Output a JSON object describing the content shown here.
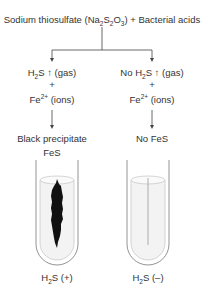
{
  "title": {
    "prefix": "Sodium thiosulfate (Na",
    "sub1": "2",
    "mid1": "S",
    "sub2": "2",
    "mid2": "O",
    "sub3": "3",
    "suffix": ") + Bacterial acids"
  },
  "left_branch": {
    "gas_prefix": "H",
    "gas_sub": "2",
    "gas_mid": "S ",
    "gas_arrow": "↑",
    "gas_suffix": " (gas)",
    "plus": "+",
    "ion_prefix": "Fe",
    "ion_sup": "2+",
    "ion_suffix": " (ions)",
    "result_line1": "Black precipitate",
    "result_line2": "FeS",
    "tube_label_prefix": "H",
    "tube_label_sub": "2",
    "tube_label_suffix": "S (+)"
  },
  "right_branch": {
    "gas_prefix": "No H",
    "gas_sub": "2",
    "gas_mid": "S ",
    "gas_arrow": "↑",
    "gas_suffix": " (gas)",
    "plus": "+",
    "ion_prefix": "Fe",
    "ion_sup": "2+",
    "ion_suffix": " (ions)",
    "result_line1": "No FeS",
    "tube_label_prefix": "H",
    "tube_label_sub": "2",
    "tube_label_suffix": "S (–)"
  },
  "colors": {
    "text": "#333333",
    "line": "#444444",
    "precipitate": "#111111",
    "medium": "#eeeeee",
    "tube_outline": "#888888"
  }
}
